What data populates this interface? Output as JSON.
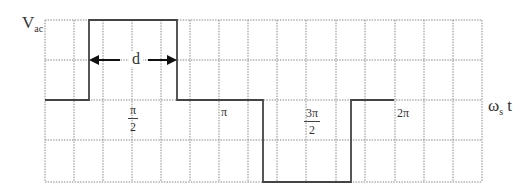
{
  "diagram": {
    "y_label": {
      "main": "V",
      "sub": "ac"
    },
    "x_label": {
      "main": "ω",
      "sub": "s",
      "tail": " t"
    },
    "pulse_width_label": "d",
    "tick_labels": {
      "pi_over_2": {
        "num": "π",
        "den": "2"
      },
      "pi": "π",
      "three_pi_over_2": {
        "num": "3π",
        "den": "2"
      },
      "two_pi": "2π"
    },
    "colors": {
      "grid": "#888888",
      "waveform": "#333333",
      "arrow": "#111111"
    }
  }
}
